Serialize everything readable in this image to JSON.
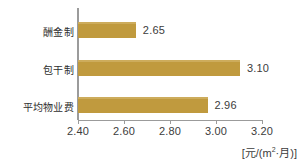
{
  "chart_data": {
    "type": "bar",
    "orientation": "horizontal",
    "title": "",
    "xlabel": "[元/(m²·月)]",
    "ylabel": "",
    "categories": [
      "酬金制",
      "包干制",
      "平均物业费"
    ],
    "values": [
      2.65,
      3.1,
      2.96
    ],
    "value_labels": [
      "2.65",
      "3.10",
      "2.96"
    ],
    "xlim": [
      2.4,
      3.2
    ],
    "xticks": [
      2.4,
      2.6,
      2.8,
      3.0,
      3.2
    ],
    "xtick_labels": [
      "2.40",
      "2.60",
      "2.80",
      "3.00",
      "3.20"
    ],
    "grid": false,
    "legend": false,
    "bar_color": "#c09a3e",
    "bar_highlight_color": "#cdac5c",
    "axis_color": "#9b9b9b",
    "text_color": "#3c3c3c"
  },
  "axis": {
    "unit_prefix": "[元/(",
    "unit_m": "m",
    "unit_sup": "2",
    "unit_mid": "·月)]"
  }
}
